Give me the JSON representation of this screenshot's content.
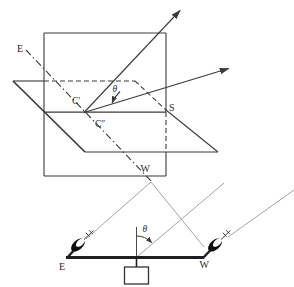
{
  "diagram": {
    "top_figure": {
      "label_e": "E",
      "label_w": "W",
      "label_s": "S",
      "label_c_prime": "C′",
      "label_c_double_prime": "C″",
      "label_theta": "θ"
    },
    "bottom_figure": {
      "label_e": "E",
      "label_w": "W",
      "label_theta": "θ"
    },
    "colors": {
      "primary_line": "#3a3a3a",
      "structure_line": "#1f1f1f",
      "thin_ray": "#9a9a9a",
      "dish_fill": "#0d0d0d",
      "background": "#ffffff"
    }
  }
}
